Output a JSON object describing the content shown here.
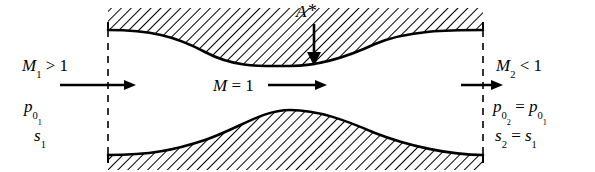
{
  "figure": {
    "type": "schematic-diagram",
    "background": "#ffffff",
    "line_color": "#000000"
  },
  "labels": {
    "inlet_mach": {
      "symbol": "M",
      "subscript": "1",
      "relation": ">",
      "value": "1",
      "text": "M1 > 1"
    },
    "inlet_pressure": {
      "symbol": "p",
      "subscript": "0",
      "subsubscript": "1",
      "text": "p01"
    },
    "inlet_entropy": {
      "symbol": "s",
      "subscript": "1",
      "text": "s1"
    },
    "throat_mach": {
      "text": "M = 1"
    },
    "throat_area": {
      "symbol": "A",
      "star": "*",
      "text": "A*"
    },
    "outlet_mach": {
      "symbol": "M",
      "subscript": "2",
      "relation": "<",
      "value": "1",
      "text": "M2 < 1"
    },
    "outlet_pressure": {
      "symbol": "p",
      "subscript": "0",
      "subsubscript": "2",
      "equals": "=",
      "rhs_symbol": "p",
      "rhs_subscript": "0",
      "rhs_subsubscript": "1",
      "text": "p02 = p01"
    },
    "outlet_entropy": {
      "symbol": "s",
      "subscript": "2",
      "equals": "=",
      "rhs_symbol": "s",
      "rhs_subscript": "1",
      "text": "s2 = s1"
    }
  },
  "geometry": {
    "inlet_station_x": 108,
    "outlet_station_x": 483,
    "throat_x": 290,
    "upper_wall_inlet_y": 30,
    "upper_wall_throat_y": 66,
    "upper_wall_outlet_y": 30,
    "lower_wall_inlet_y": 155,
    "lower_wall_throat_y": 110,
    "lower_wall_outlet_y": 155,
    "hatch_angle_deg": 45,
    "hatch_direction": "forward-slash"
  },
  "flow_arrows": {
    "inlet": {
      "x1": 60,
      "x2": 136,
      "y": 85,
      "direction": "right"
    },
    "throat": {
      "x1": 268,
      "x2": 327,
      "y": 85,
      "direction": "right"
    },
    "outlet": {
      "x1": 461,
      "x2": 503,
      "y": 85,
      "direction": "right"
    },
    "area_pointer": {
      "x": 314,
      "y1": 24,
      "y2": 64,
      "direction": "down"
    }
  }
}
